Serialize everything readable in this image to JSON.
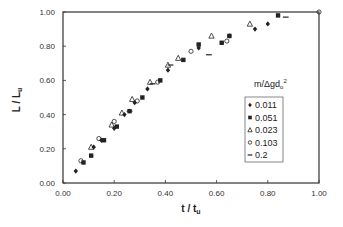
{
  "chart_data": {
    "type": "scatter",
    "title": "",
    "xlabel": "t / t_u",
    "ylabel": "L / L_u",
    "xlim": [
      0,
      1.0
    ],
    "ylim": [
      0,
      1.0
    ],
    "x_ticks": [
      "0.00",
      "0.20",
      "0.40",
      "0.60",
      "0.80",
      "1.00"
    ],
    "y_ticks": [
      "0.00",
      "0.20",
      "0.40",
      "0.60",
      "0.80",
      "1.00"
    ],
    "grid": false,
    "legend": {
      "title": "m/Δgd₀²",
      "position": "inside right"
    },
    "series": [
      {
        "name": "0.011",
        "marker": "diamond",
        "points": [
          [
            0.05,
            0.07
          ],
          [
            0.12,
            0.21
          ],
          [
            0.15,
            0.25
          ],
          [
            0.2,
            0.32
          ],
          [
            0.24,
            0.4
          ],
          [
            0.28,
            0.47
          ],
          [
            0.33,
            0.55
          ],
          [
            0.41,
            0.66
          ],
          [
            0.53,
            0.79
          ],
          [
            0.65,
            0.86
          ],
          [
            0.75,
            0.9
          ],
          [
            0.8,
            0.93
          ]
        ]
      },
      {
        "name": "0.051",
        "marker": "square",
        "points": [
          [
            0.08,
            0.12
          ],
          [
            0.11,
            0.16
          ],
          [
            0.16,
            0.25
          ],
          [
            0.21,
            0.33
          ],
          [
            0.26,
            0.42
          ],
          [
            0.31,
            0.5
          ],
          [
            0.38,
            0.6
          ],
          [
            0.47,
            0.72
          ],
          [
            0.53,
            0.81
          ],
          [
            0.62,
            0.82
          ],
          [
            0.65,
            0.86
          ],
          [
            0.84,
            0.98
          ]
        ]
      },
      {
        "name": "0.023",
        "marker": "triangle",
        "points": [
          [
            0.11,
            0.21
          ],
          [
            0.19,
            0.34
          ],
          [
            0.23,
            0.41
          ],
          [
            0.27,
            0.49
          ],
          [
            0.34,
            0.59
          ],
          [
            0.41,
            0.69
          ],
          [
            0.45,
            0.73
          ],
          [
            0.58,
            0.86
          ],
          [
            0.73,
            0.93
          ]
        ]
      },
      {
        "name": "0.103",
        "marker": "circle",
        "points": [
          [
            0.07,
            0.13
          ],
          [
            0.14,
            0.26
          ],
          [
            0.2,
            0.36
          ],
          [
            0.29,
            0.48
          ],
          [
            0.37,
            0.59
          ],
          [
            0.5,
            0.77
          ],
          [
            0.64,
            0.83
          ],
          [
            1.0,
            1.0
          ]
        ]
      },
      {
        "name": "0.2",
        "marker": "dash",
        "points": [
          [
            0.26,
            0.42
          ],
          [
            0.35,
            0.58
          ],
          [
            0.42,
            0.69
          ],
          [
            0.57,
            0.75
          ],
          [
            0.87,
            0.97
          ]
        ]
      }
    ]
  },
  "layout": {
    "plot": {
      "left": 63,
      "top": 12,
      "right": 319,
      "bottom": 183
    },
    "colors": {
      "axis": "#333333",
      "marker": "#222222"
    }
  }
}
